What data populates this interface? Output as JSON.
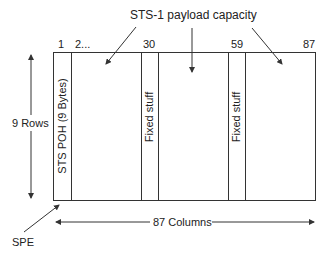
{
  "diagram": {
    "title": "STS-1 payload capacity",
    "column_numbers": [
      "1",
      "2...",
      "30",
      "59",
      "87"
    ],
    "rows_label": "9 Rows",
    "columns_label": "87 Columns",
    "spe_label": "SPE",
    "poh_label": "STS POH (9 Bytes)",
    "fixed_stuff_1": "Fixed stuff",
    "fixed_stuff_2": "Fixed stuff",
    "line_color": "#333333"
  }
}
